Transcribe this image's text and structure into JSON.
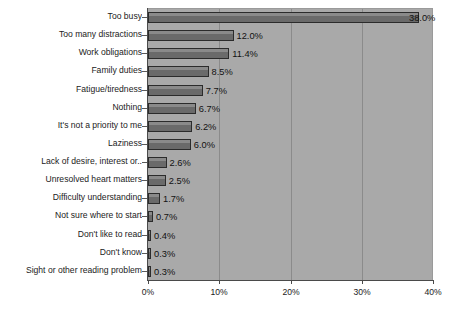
{
  "chart_data": {
    "type": "bar",
    "orientation": "horizontal",
    "title": "",
    "subtitle": "",
    "xlabel": "",
    "ylabel": "",
    "xlim": [
      0,
      40
    ],
    "xticks": [
      0,
      10,
      20,
      30,
      40
    ],
    "xtick_labels": [
      "0%",
      "10%",
      "20%",
      "30%",
      "40%"
    ],
    "grid": true,
    "grid_axis": "x",
    "legend": false,
    "categories": [
      "Too busy",
      "Too many distractions",
      "Work obligations",
      "Family duties",
      "Fatigue/tiredness",
      "Nothing",
      "It's not a priority to me",
      "Laziness",
      "Lack of desire, interest or..",
      "Unresolved heart matters",
      "Difficulty understanding",
      "Not sure where to start",
      "Don't like to read",
      "Don't know",
      "Sight or other reading problem"
    ],
    "values": [
      38.0,
      12.0,
      11.4,
      8.5,
      7.7,
      6.7,
      6.2,
      6.0,
      2.6,
      2.5,
      1.7,
      0.7,
      0.4,
      0.3,
      0.3
    ],
    "data_labels": [
      "38.0%",
      "12.0%",
      "11.4%",
      "8.5%",
      "7.7%",
      "6.7%",
      "6.2%",
      "6.0%",
      "2.6%",
      "2.5%",
      "1.7%",
      "0.7%",
      "0.4%",
      "0.3%",
      "0.3%"
    ],
    "colors": {
      "plot_background": "#a9a9a9",
      "figure_background": "#ffffff",
      "bar_fill": "#6e6e6e",
      "bar_edge": "#2b2b2b",
      "gridline": "#8b8b8b",
      "axis": "#4a4a4a",
      "text": "#1b1b1b"
    }
  }
}
